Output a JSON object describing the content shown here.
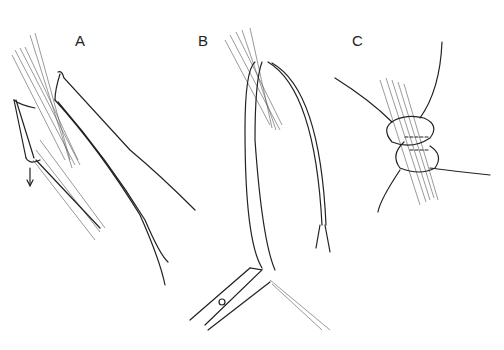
{
  "figure": {
    "panels": [
      {
        "label": "A",
        "description": "tendon passed through with suture loops, traction arrow downward"
      },
      {
        "label": "B",
        "description": "suture strands pulled through tendon, held by needle holder"
      },
      {
        "label": "C",
        "description": "completed suture loops around tendon junction"
      }
    ],
    "colors": {
      "ink": "#222222",
      "background": "#ffffff"
    }
  }
}
